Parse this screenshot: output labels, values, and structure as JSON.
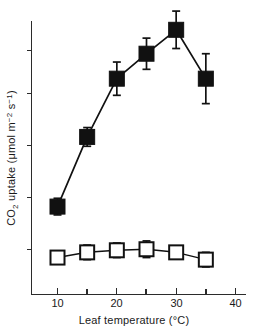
{
  "chart_data": {
    "type": "line",
    "title": "",
    "subtitle": "",
    "xlabel": "Leaf temperature (°C)",
    "ylabel": "CO₂ uptake (μmol m⁻² s⁻¹)",
    "x": [
      10,
      15,
      20,
      25,
      30,
      35
    ],
    "xlim": [
      5,
      40
    ],
    "ylim": [
      0,
      29
    ],
    "grid": false,
    "legend": "none",
    "xticks_major": [
      10,
      20,
      30,
      40
    ],
    "xticks_minor": [
      15,
      25,
      35
    ],
    "xtick_labels": [
      "10",
      "20",
      "30",
      "40"
    ],
    "yticks": [
      5,
      10,
      15,
      20,
      25
    ],
    "ytick_labels": [
      "",
      "",
      "",
      "",
      ""
    ],
    "series": [
      {
        "name": "filled-squares",
        "marker": "filled-square",
        "values": [
          8.5,
          15.2,
          20.8,
          23.2,
          25.5,
          20.8
        ],
        "error": [
          0.8,
          0.9,
          1.6,
          1.5,
          1.8,
          2.4
        ]
      },
      {
        "name": "open-squares",
        "marker": "open-square",
        "values": [
          3.6,
          4.1,
          4.3,
          4.4,
          4.1,
          3.4
        ],
        "error": [
          0.0,
          0.7,
          0.7,
          0.8,
          0.0,
          0.7
        ]
      }
    ],
    "colors": {
      "axis": "#2b2b2b",
      "line": "#111111",
      "filled_marker": "#111111",
      "open_marker_fill": "#ffffff",
      "open_marker_stroke": "#111111",
      "background": "#ffffff"
    },
    "ylabel_parts": {
      "prefix": "CO",
      "sub_2": "2",
      "mid": " uptake (μmol m",
      "sup_1": "−2",
      "mid2": " s",
      "sup_2": "−1",
      "suffix": ")"
    }
  }
}
